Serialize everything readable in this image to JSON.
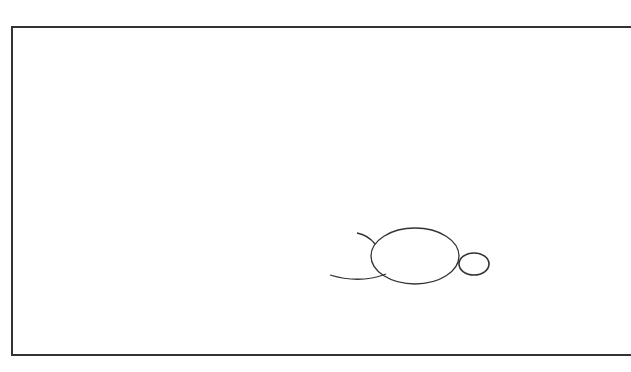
{
  "drawing": {
    "description": "Hand-drawn line sketch of a simple figure (turtle-like shape) inside a rectangular frame",
    "stroke_color": "#333333",
    "background_color": "#ffffff",
    "frame": {
      "x": 11,
      "y": 26,
      "right_edge_visible": false,
      "bottom": 356
    },
    "shapes": {
      "body": {
        "type": "ellipse",
        "cx": 415,
        "cy": 256,
        "rx": 44,
        "ry": 28
      },
      "head": {
        "type": "ellipse",
        "cx": 474,
        "cy": 264,
        "rx": 15,
        "ry": 11
      },
      "upper_limb": {
        "type": "arc",
        "path": "M357,233 Q368,235 375,244"
      },
      "lower_limb": {
        "type": "arc",
        "path": "M330,275 Q360,284 386,274"
      }
    }
  }
}
